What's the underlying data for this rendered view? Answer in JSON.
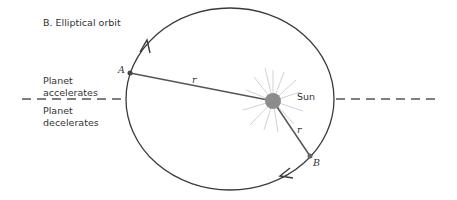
{
  "title": "B.  Elliptical orbit",
  "labels": {
    "planet_accelerates_line1": "Planet",
    "planet_accelerates_line2": "accelerates",
    "planet_decelerates_line1": "Planet",
    "planet_decelerates_line2": "decelerates",
    "sun": "Sun",
    "point_a": "A",
    "point_b": "B",
    "radius_a": "r",
    "radius_b": "r"
  },
  "colors": {
    "orbit": "#3a3a3a",
    "sun": "#8c8c8c",
    "rays": "#d0d0d0",
    "dash": "#555555",
    "text": "#333333"
  }
}
